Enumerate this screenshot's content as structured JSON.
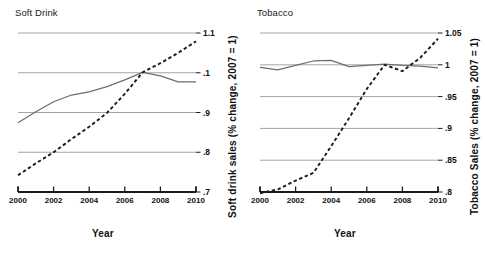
{
  "figure": {
    "xlabel": "Year",
    "panels": [
      {
        "key": "soft_drink",
        "title": "Soft Drink",
        "ylabel": "Soft drink sales (% change, 2007 = 1)"
      },
      {
        "key": "tobacco",
        "title": "Tobacco",
        "ylabel": "Tobacco Sales (% change, 2007 = 1)"
      }
    ]
  },
  "chart_data": [
    {
      "type": "line",
      "title": "Soft Drink",
      "xlabel": "Year",
      "ylabel": "Soft drink sales (% change, 2007 = 1)",
      "xlim": [
        2000,
        2010
      ],
      "ylim": [
        0.7,
        1.1
      ],
      "xticks": [
        2000,
        2002,
        2004,
        2006,
        2008,
        2010
      ],
      "xticklabels": [
        "2000",
        "2002",
        "2004",
        "2006",
        "2008",
        "2010"
      ],
      "yticks": [
        0.7,
        0.8,
        0.9,
        1.0,
        1.1
      ],
      "yticklabels": [
        ".7",
        ".8",
        ".9",
        ".1",
        "1.1"
      ],
      "grid": true,
      "gridlines_y": [
        0.8,
        0.9,
        1.0,
        1.1
      ],
      "legend": "none",
      "x": [
        2000,
        2001,
        2002,
        2003,
        2004,
        2005,
        2006,
        2007,
        2008,
        2009,
        2010
      ],
      "series": [
        {
          "name": "solid-series",
          "style": "solid",
          "color": "#6e6e6e",
          "values": [
            0.874,
            0.902,
            0.927,
            0.944,
            0.952,
            0.965,
            0.982,
            1.001,
            0.992,
            0.977,
            0.977
          ]
        },
        {
          "name": "dashed-series",
          "style": "dashed",
          "color": "#1a1a1a",
          "values": [
            0.742,
            0.772,
            0.8,
            0.833,
            0.864,
            0.899,
            0.947,
            1.001,
            1.024,
            1.05,
            1.079
          ]
        }
      ]
    },
    {
      "type": "line",
      "title": "Tobacco",
      "xlabel": "Year",
      "ylabel": "Tobacco Sales (% change, 2007 = 1)",
      "xlim": [
        2000,
        2010
      ],
      "ylim": [
        0.8,
        1.05
      ],
      "xticks": [
        2000,
        2002,
        2004,
        2006,
        2008,
        2010
      ],
      "xticklabels": [
        "2000",
        "2002",
        "2004",
        "2006",
        "2008",
        "2010"
      ],
      "yticks": [
        0.8,
        0.85,
        0.9,
        0.95,
        1.0,
        1.05
      ],
      "yticklabels": [
        ".8",
        ".85",
        ".9",
        ".95",
        "1",
        "1.05"
      ],
      "grid": true,
      "gridlines_y": [
        0.8,
        0.85,
        0.9,
        0.95,
        1.0,
        1.05
      ],
      "legend": "none",
      "x": [
        2000,
        2001,
        2002,
        2003,
        2004,
        2005,
        2006,
        2007,
        2008,
        2009,
        2010
      ],
      "series": [
        {
          "name": "solid-series",
          "style": "solid",
          "color": "#6e6e6e",
          "values": [
            0.996,
            0.992,
            0.999,
            1.006,
            1.007,
            0.997,
            0.999,
            1.001,
            0.999,
            0.998,
            0.995
          ]
        },
        {
          "name": "dashed-series",
          "style": "dashed",
          "color": "#1a1a1a",
          "values": [
            0.798,
            0.804,
            0.818,
            0.83,
            0.872,
            0.916,
            0.962,
            1.0,
            0.99,
            1.011,
            1.041
          ]
        }
      ]
    }
  ]
}
